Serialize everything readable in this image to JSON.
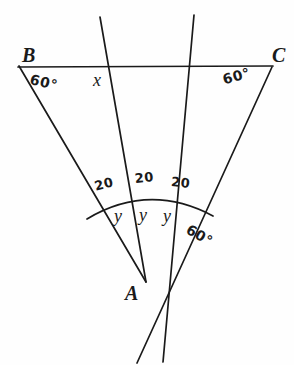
{
  "figure": {
    "type": "geometry-diagram",
    "background_color": "#fefefe",
    "ink_color": "#1a1a1a"
  },
  "vertices": [
    {
      "id": "B",
      "label": "B",
      "x": 22,
      "y": 57
    },
    {
      "id": "C",
      "label": "C",
      "x": 272,
      "y": 57
    },
    {
      "id": "A",
      "label": "A",
      "x": 131,
      "y": 296
    }
  ],
  "angle_labels": [
    {
      "id": "angle-B",
      "label": "60°",
      "x": 32,
      "y": 74,
      "rotation": 14
    },
    {
      "id": "angle-C",
      "label": "60°",
      "x": 221,
      "y": 73,
      "rotation": -16
    },
    {
      "id": "angle-A-exterior",
      "label": "60°",
      "x": 191,
      "y": 224,
      "rotation": 30
    }
  ],
  "segment_labels": [
    {
      "id": "seg-left",
      "label": "20",
      "x": 93,
      "y": 180,
      "rotation": -14
    },
    {
      "id": "seg-middle",
      "label": "20",
      "x": 134,
      "y": 172,
      "rotation": -6
    },
    {
      "id": "seg-right",
      "label": "20",
      "x": 172,
      "y": 175,
      "rotation": 6
    }
  ],
  "variable_labels": [
    {
      "id": "var-x",
      "label": "x",
      "x": 93,
      "y": 71
    },
    {
      "id": "var-y-1",
      "label": "y",
      "x": 114,
      "y": 207
    },
    {
      "id": "var-y-2",
      "label": "y",
      "x": 139,
      "y": 206
    },
    {
      "id": "var-y-3",
      "label": "y",
      "x": 163,
      "y": 207
    }
  ],
  "lines": [
    {
      "id": "base-BC",
      "x1": 18,
      "y1": 67,
      "x2": 273,
      "y2": 66
    },
    {
      "id": "side-AB",
      "x1": 19,
      "y1": 66,
      "x2": 146,
      "y2": 282
    },
    {
      "id": "side-AC-extended",
      "x1": 272,
      "y1": 67,
      "x2": 137,
      "y2": 363
    },
    {
      "id": "cevian-left-extended",
      "x1": 100,
      "y1": 17,
      "x2": 146,
      "y2": 282
    },
    {
      "id": "cevian-right-extended",
      "x1": 194,
      "y1": 15,
      "x2": 163,
      "y2": 362
    }
  ],
  "arc": {
    "id": "angle-arc-at-A",
    "start_x": 87,
    "start_y": 219,
    "apex_x": 149,
    "apex_y": 190,
    "end_x": 213,
    "end_y": 216
  }
}
